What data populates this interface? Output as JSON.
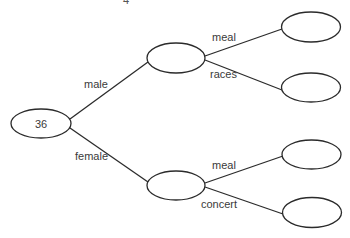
{
  "diagram": {
    "type": "tree",
    "top_cut_text": "4",
    "root": {
      "label": "36"
    },
    "level1": [
      {
        "edge_label": "male"
      },
      {
        "edge_label": "female"
      }
    ],
    "level2": [
      {
        "parent": "male",
        "edge_label": "meal",
        "label": ""
      },
      {
        "parent": "male",
        "edge_label": "races",
        "label": ""
      },
      {
        "parent": "female",
        "edge_label": "meal",
        "label": ""
      },
      {
        "parent": "female",
        "edge_label": "concert",
        "label": ""
      }
    ],
    "colors": {
      "line": "#2b2b2b",
      "text": "#3a3a3a",
      "background": "#ffffff"
    }
  }
}
